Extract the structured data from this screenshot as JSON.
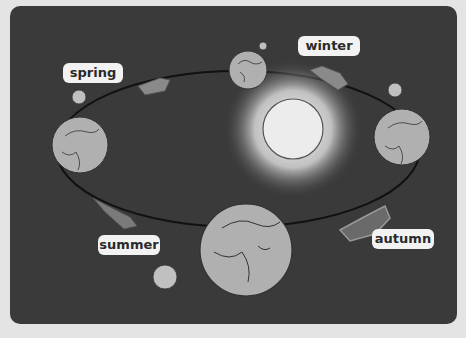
{
  "diagram": {
    "type": "earth-orbit-seasons",
    "labels": {
      "spring": "spring",
      "winter": "winter",
      "summer": "summer",
      "autumn": "autumn"
    },
    "center": "sun",
    "colors": {
      "background": "#3a3a3a",
      "outer": "#e4e4e4",
      "earth": "#b0b0b0",
      "sun": "#e8e8e8",
      "arrow": "#8a8a8a",
      "label_bg": "#f2f2f2"
    }
  }
}
